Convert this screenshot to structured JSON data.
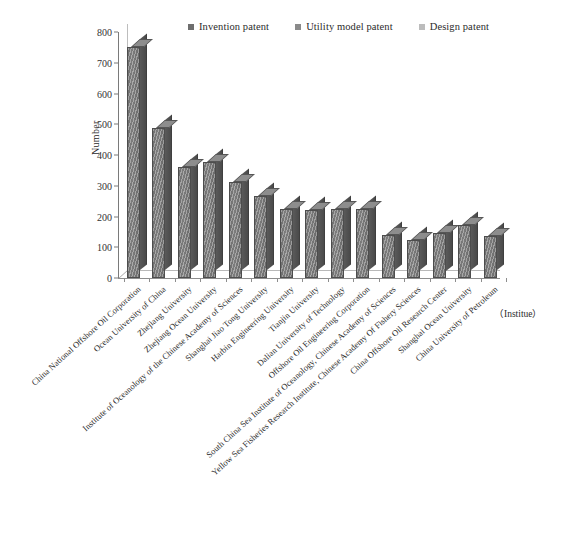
{
  "legend": {
    "position": "top-center",
    "items": [
      {
        "label": "Invention patent",
        "color": "#6e6e6e",
        "swatch": "legend-swatch-invention"
      },
      {
        "label": "Utility model patent",
        "color": "#8a8a8a",
        "swatch": "legend-swatch-utility"
      },
      {
        "label": "Design patent",
        "color": "#bcbcbc",
        "swatch": "legend-swatch-design"
      }
    ]
  },
  "axis": {
    "y_label": "Number",
    "x_unit": "（Institue）",
    "y_ticks": [
      "0",
      "100",
      "200",
      "300",
      "400",
      "500",
      "600",
      "700",
      "800"
    ]
  },
  "chart_data": {
    "type": "bar",
    "title": "",
    "xlabel": "（Institue）",
    "ylabel": "Number",
    "ylim": [
      0,
      800
    ],
    "ytick_step": 100,
    "grid": false,
    "legend_position": "top-center",
    "categories": [
      "China National Offshore Oil Corporation",
      "Ocean University of China",
      "Zhejiang University",
      "Zhejiang Ocean University",
      "Institute of Oceanology of the Chinese Academy of Sciences",
      "Shanghai Jiao Tong University",
      "Harbin Engineering University",
      "Tianjin University",
      "Dalian University of Technology",
      "Offshore Oil Engineering Corporation",
      "South China Sea Institute of Oceanology, Chinese Academy of Sciences",
      "Yellow Sea Fisheries Research Institute, Chinese Academy Of Fishery Sciences",
      "China Offshore Oil Research Center",
      "Shanghai Ocean University",
      "China University of Petroleum"
    ],
    "series": [
      {
        "name": "Invention patent",
        "color": "#6e6e6e",
        "values": [
          752,
          487,
          360,
          378,
          313,
          267,
          225,
          222,
          224,
          226,
          141,
          124,
          148,
          172,
          136
        ]
      }
    ]
  }
}
